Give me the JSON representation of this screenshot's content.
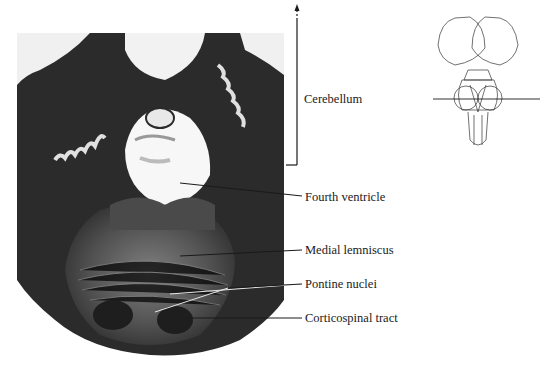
{
  "figure": {
    "labels": {
      "cerebellum": "Cerebellum",
      "fourth_ventricle": "Fourth ventricle",
      "medial_lemniscus": "Medial lemniscus",
      "pontine_nuclei": "Pontine nuclei",
      "corticospinal_tract": "Corticospinal tract"
    },
    "inset": {
      "description": "Dorsal view of brainstem with horizontal line indicating section level"
    },
    "colors": {
      "tissue_dark": "#2a2a2a",
      "tissue_mid": "#6e6e6e",
      "ventricle": "#f7f7f7",
      "line": "#1a1a1a",
      "background": "#ffffff"
    }
  }
}
